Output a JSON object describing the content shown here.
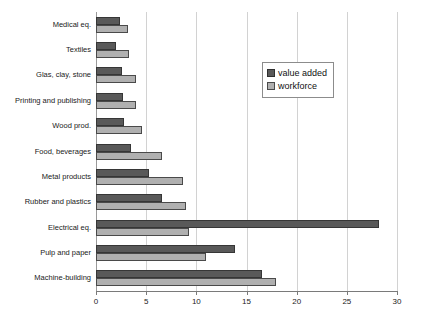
{
  "chart_data": {
    "type": "bar",
    "orientation": "horizontal",
    "title": "",
    "xlabel": "",
    "ylabel": "",
    "xlim": [
      0,
      30
    ],
    "xticks": [
      0,
      5,
      10,
      15,
      20,
      25,
      30
    ],
    "xtick_labels": [
      "0",
      "5",
      "10",
      "15",
      "20",
      "25",
      "30"
    ],
    "grid": true,
    "legend_position": "upper right",
    "categories": [
      "Medical eq.",
      "Textiles",
      "Glas, clay, stone",
      "Printing and publishing",
      "Wood prod.",
      "Food, beverages",
      "Metal products",
      "Rubber and plastics",
      "Electrical eq.",
      "Pulp and paper",
      "Machine-building"
    ],
    "series": [
      {
        "name": "value added",
        "color": "#595959",
        "values": [
          2.4,
          2.0,
          2.6,
          2.7,
          2.8,
          3.5,
          5.3,
          6.6,
          28.2,
          13.9,
          16.5
        ]
      },
      {
        "name": "workforce",
        "color": "#b0b0b0",
        "values": [
          3.2,
          3.3,
          4.0,
          4.0,
          4.6,
          6.6,
          8.7,
          9.0,
          9.3,
          11.0,
          17.9
        ]
      }
    ]
  },
  "legend": {
    "items": [
      {
        "label": "value added"
      },
      {
        "label": "workforce"
      }
    ]
  }
}
